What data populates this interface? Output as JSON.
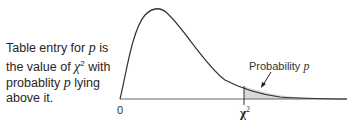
{
  "caption": {
    "line1_pre": "Table entry for ",
    "line1_var": "p",
    "line1_post": " is",
    "line2_pre": "the value of ",
    "line2_sym": "χ",
    "line2_sup": "2",
    "line2_post": " with",
    "line3_pre": "probablity ",
    "line3_var": "p",
    "line3_post": " lying",
    "line4": "above it."
  },
  "diagram": {
    "origin_label": "0",
    "critical_label": "χ",
    "critical_sup": "2",
    "area_label": "Probability ",
    "area_var": "p",
    "curve_color": "#333333",
    "shade_color": "#d9d9d9",
    "axis_color": "#555555"
  }
}
